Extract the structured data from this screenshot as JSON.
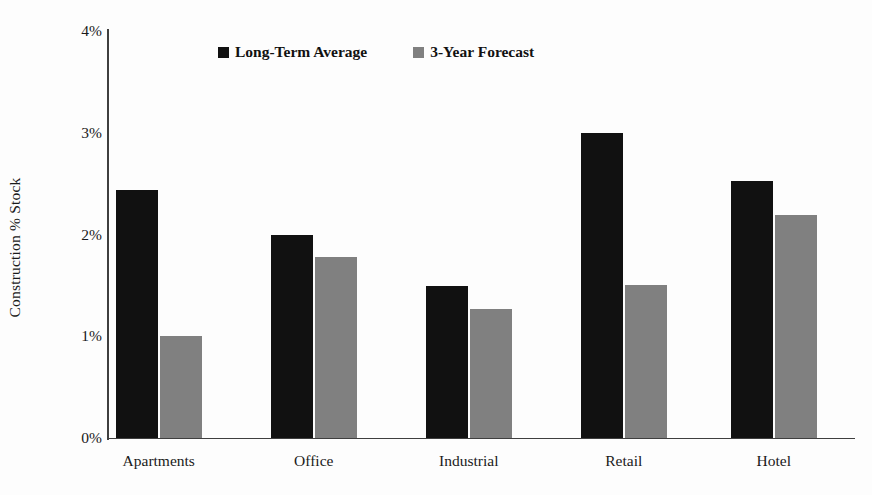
{
  "chart_data": {
    "type": "bar",
    "title": "",
    "xlabel": "",
    "ylabel": "Construction % Stock",
    "ylim": [
      0,
      4
    ],
    "ytick_labels": [
      "4%",
      "3%",
      "2%",
      "1%",
      "0%"
    ],
    "ytick_values": [
      4,
      3,
      2,
      1,
      0
    ],
    "grid": false,
    "legend_position": "top-center",
    "categories": [
      "Apartments",
      "Office",
      "Industrial",
      "Retail",
      "Hotel"
    ],
    "series": [
      {
        "name": "Long-Term Average",
        "color": "#111111",
        "values": [
          2.44,
          2.0,
          1.49,
          3.0,
          2.53
        ]
      },
      {
        "name": "3-Year Forecast",
        "color": "#808080",
        "values": [
          1.0,
          1.78,
          1.27,
          1.5,
          2.19
        ]
      }
    ]
  }
}
